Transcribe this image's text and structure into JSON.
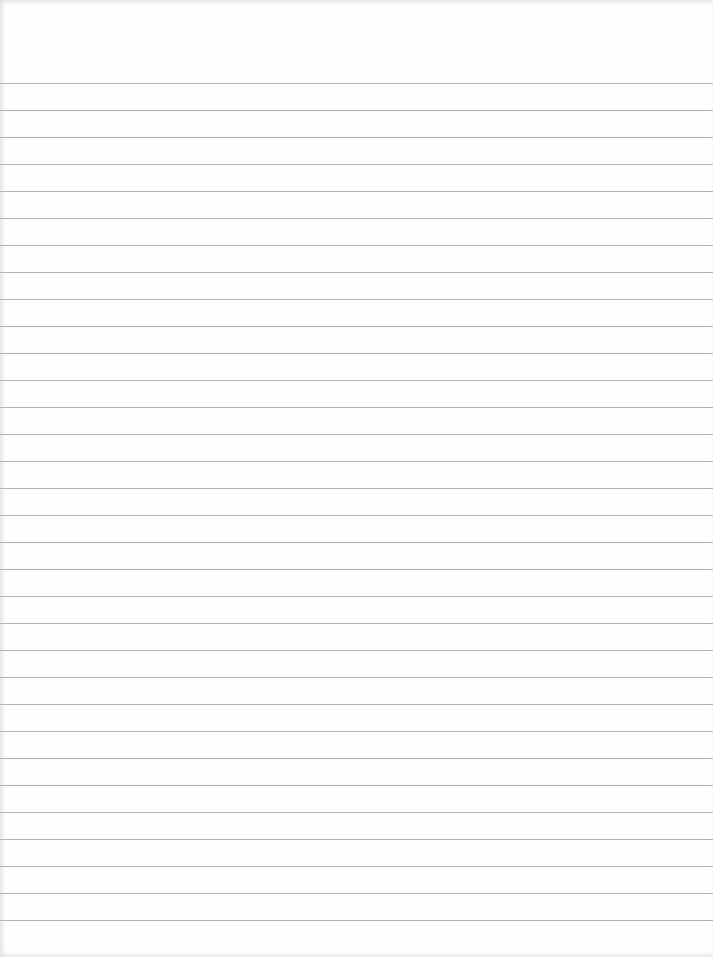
{
  "paper": {
    "type": "lined-paper",
    "background_color": "#fefefe",
    "line_color": "#b3b3b3",
    "first_line_y": 83,
    "line_spacing": 27,
    "line_count": 32
  }
}
